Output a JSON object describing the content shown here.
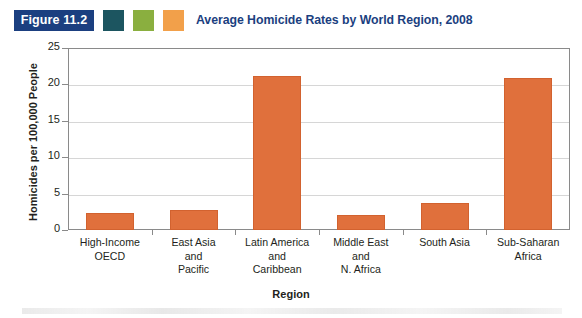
{
  "figure": {
    "badge_label": "Figure 11.2",
    "title": "Average Homicide Rates by World Region, 2008",
    "title_color": "#1b3f80",
    "badge_bg": "#1b3f80",
    "swatches": [
      {
        "name": "swatch-teal",
        "color": "#1c5560"
      },
      {
        "name": "swatch-green",
        "color": "#8aaf3f"
      },
      {
        "name": "swatch-orange",
        "color": "#f2a04a"
      }
    ]
  },
  "chart_data": {
    "type": "bar",
    "title": "Average Homicide Rates by World Region, 2008",
    "xlabel": "Region",
    "ylabel": "Homicides per 100,000 People",
    "categories": [
      "High-Income\nOECD",
      "East Asia\nand\nPacific",
      "Latin America\nand\nCaribbean",
      "Middle East\nand\nN. Africa",
      "South Asia",
      "Sub-Saharan\nAfrica"
    ],
    "category_lines": [
      [
        "High-Income",
        "OECD"
      ],
      [
        "East Asia",
        "and",
        "Pacific"
      ],
      [
        "Latin America",
        "and",
        "Caribbean"
      ],
      [
        "Middle East",
        "and",
        "N. Africa"
      ],
      [
        "South Asia"
      ],
      [
        "Sub-Saharan",
        "Africa"
      ]
    ],
    "values": [
      2.3,
      2.7,
      21.2,
      2.0,
      3.7,
      20.9
    ],
    "ylim": [
      0,
      25
    ],
    "yticks": [
      0,
      5,
      10,
      15,
      20,
      25
    ],
    "ytick_labels": [
      "0",
      "5",
      "10",
      "15",
      "20",
      "25"
    ],
    "grid": "horizontal",
    "legend": "none",
    "bar_color": "#e0703c",
    "gridline_color": "#d6d6d6",
    "axis_color": "#8a8a8a"
  }
}
